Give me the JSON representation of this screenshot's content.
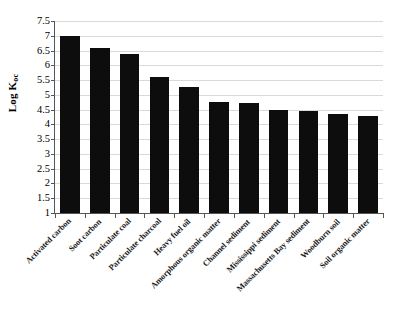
{
  "chart_data": {
    "type": "bar",
    "title": "",
    "subtitle": "",
    "xlabel": "",
    "ylabel": "Log Koc",
    "ylabel_base": "Log K",
    "ylabel_sub": "oc",
    "ylim": [
      1,
      7.5
    ],
    "ytick_step": 0.5,
    "grid": true,
    "legend": null,
    "legend_position": "none",
    "bar_color": "#0d0d0d",
    "gridline_color": "#d9d9d9",
    "axis_color": "#555555",
    "background_color": "#ffffff",
    "categories": [
      "Activated carbon",
      "Soot carbon",
      "Particulate coal",
      "Particulate charcoal",
      "Heavy fuel oil",
      "Amorphous organic matter",
      "Channel sediment",
      "Mississippi sediment",
      "Massachusetts Bay sediment",
      "Woodburn soil",
      "Soil organic matter"
    ],
    "values": [
      7.0,
      6.6,
      6.4,
      5.6,
      5.25,
      4.75,
      4.72,
      4.5,
      4.45,
      4.35,
      4.3
    ],
    "yticks": [
      "1",
      "1.5",
      "2",
      "2.5",
      "3",
      "3.5",
      "4",
      "4.5",
      "5",
      "5.5",
      "6",
      "6.5",
      "7",
      "7.5"
    ],
    "ytick_values": [
      1,
      1.5,
      2,
      2.5,
      3,
      3.5,
      4,
      4.5,
      5,
      5.5,
      6,
      6.5,
      7,
      7.5
    ]
  }
}
